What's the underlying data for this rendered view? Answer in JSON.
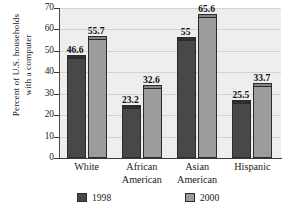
{
  "chart_data": {
    "type": "bar",
    "title": "",
    "xlabel": "",
    "ylabel": "Percent of U.S. households with a computer",
    "ylabel_lines": [
      "Percent of U.S. households",
      "with a computer"
    ],
    "categories": [
      "White",
      "African American",
      "Asian American",
      "Hispanic"
    ],
    "category_lines": [
      [
        "White",
        ""
      ],
      [
        "African",
        "American"
      ],
      [
        "Asian",
        "American"
      ],
      [
        "Hispanic",
        ""
      ]
    ],
    "series": [
      {
        "name": "1998",
        "color": "#484848",
        "values": [
          46.6,
          23.2,
          55,
          25.5
        ],
        "labels": [
          "46.6",
          "23.2",
          "55",
          "25.5"
        ]
      },
      {
        "name": "2000",
        "color": "#9c9c9c",
        "values": [
          55.7,
          32.6,
          65.6,
          33.7
        ],
        "labels": [
          "55.7",
          "32.6",
          "65.6",
          "33.7"
        ]
      }
    ],
    "ylim": [
      0,
      70
    ],
    "yticks": [
      0,
      10,
      20,
      30,
      40,
      50,
      60,
      70
    ],
    "ytick_labels": [
      "0",
      "10",
      "20",
      "30",
      "40",
      "50",
      "60",
      "70"
    ],
    "grid": true,
    "legend_position": "bottom",
    "legend": [
      "1998",
      "2000"
    ],
    "plot_background": "#eeeeee"
  },
  "footer": {
    "cutoff_text": ""
  }
}
